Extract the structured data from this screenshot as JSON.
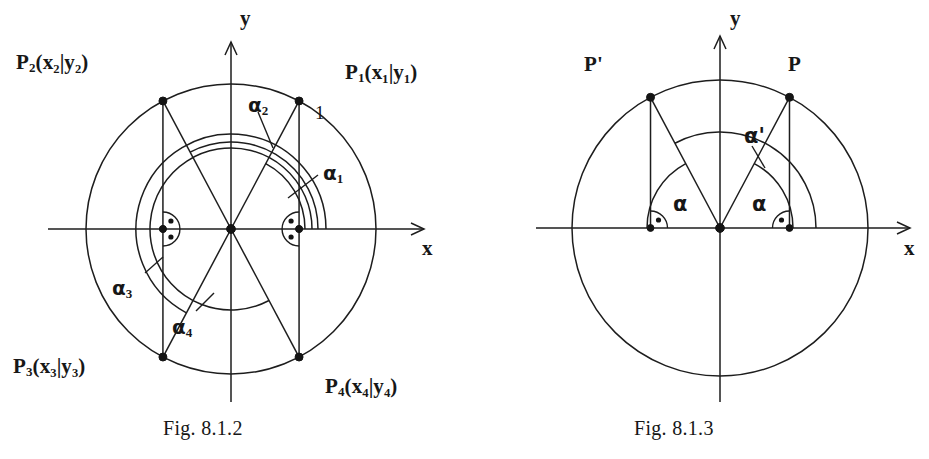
{
  "figures": [
    {
      "id": "fig-8-1-2",
      "caption": "Fig. 8.1.2",
      "caption_x": 163,
      "caption_y": 418,
      "center": {
        "x": 231,
        "y": 229
      },
      "radius": 145,
      "axes": {
        "x_label": "x",
        "y_label": "y",
        "x_label_x": 422,
        "x_label_y": 238,
        "y_label_x": 240,
        "y_label_y": 8
      },
      "radius_label": {
        "text": "1",
        "x": 315,
        "y": 103
      },
      "points": [
        {
          "name": "P1",
          "label": "P",
          "sub": "1",
          "coords": "(x₁|y₁)",
          "angle_deg": 62,
          "label_x": 345,
          "label_y": 62
        },
        {
          "name": "P2",
          "label": "P",
          "sub": "2",
          "coords": "(x₂|y₂)",
          "angle_deg": 118,
          "label_x": 16,
          "label_y": 52
        },
        {
          "name": "P3",
          "label": "P",
          "sub": "3",
          "coords": "(x₃|y₃)",
          "angle_deg": 242,
          "label_x": 13,
          "label_y": 356
        },
        {
          "name": "P4",
          "label": "P",
          "sub": "4",
          "coords": "(x₄|y₄)",
          "angle_deg": 298,
          "label_x": 325,
          "label_y": 376
        }
      ],
      "angle_arcs": [
        {
          "name": "alpha1",
          "label": "α",
          "sub": "1",
          "radius": 74,
          "start_deg": 0,
          "end_deg": 62,
          "label_x": 323,
          "label_y": 163,
          "leader": [
            [
              318,
              175
            ],
            [
              288,
              198
            ]
          ]
        },
        {
          "name": "alpha2",
          "label": "α",
          "sub": "2",
          "radius": 87,
          "start_deg": 0,
          "end_deg": 118,
          "label_x": 248,
          "label_y": 95,
          "leader": [
            [
              258,
              112
            ],
            [
              273,
              148
            ]
          ]
        },
        {
          "name": "alpha3",
          "label": "α",
          "sub": "3",
          "radius": 95,
          "start_deg": 0,
          "end_deg": 242,
          "label_x": 112,
          "label_y": 278,
          "leader": [
            [
              145,
              273
            ],
            [
              163,
              257
            ]
          ]
        },
        {
          "name": "alpha4",
          "label": "α",
          "sub": "4",
          "radius": 81,
          "start_deg": 0,
          "end_deg": 298,
          "label_x": 172,
          "label_y": 317,
          "leader": [
            [
              196,
              311
            ],
            [
              214,
              293
            ]
          ]
        }
      ]
    },
    {
      "id": "fig-8-1-3",
      "caption": "Fig. 8.1.3",
      "caption_x": 634,
      "caption_y": 418,
      "center": {
        "x": 720,
        "y": 228
      },
      "radius": 148,
      "axes": {
        "x_label": "x",
        "y_label": "y",
        "x_label_x": 904,
        "x_label_y": 238,
        "y_label_x": 730,
        "y_label_y": 8
      },
      "points": [
        {
          "name": "P",
          "label": "P",
          "sub": "",
          "coords": "",
          "angle_deg": 62,
          "label_x": 788,
          "label_y": 54
        },
        {
          "name": "P-prime",
          "label": "P'",
          "sub": "",
          "coords": "",
          "angle_deg": 118,
          "label_x": 584,
          "label_y": 54
        }
      ],
      "angle_arcs": [
        {
          "name": "alpha-right",
          "label": "α",
          "radius": 73,
          "start_deg": 0,
          "end_deg": 62,
          "label_x": 752,
          "label_y": 194
        },
        {
          "name": "alpha-left",
          "label": "α",
          "radius": 73,
          "start_deg": 118,
          "end_deg": 180,
          "label_x": 673,
          "label_y": 194
        },
        {
          "name": "alpha-prime",
          "label": "α'",
          "radius": 96,
          "start_deg": 0,
          "end_deg": 118,
          "label_x": 744,
          "label_y": 126,
          "leader": [
            [
              752,
              146
            ],
            [
              765,
              168
            ]
          ]
        }
      ]
    }
  ]
}
